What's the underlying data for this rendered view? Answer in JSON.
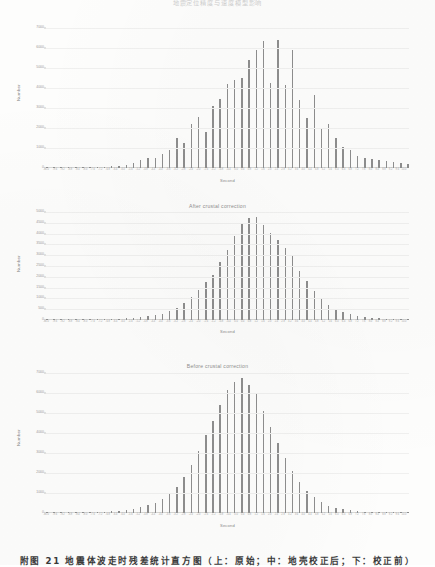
{
  "document": {
    "header_title": "地震定位精度与速度模型影响",
    "caption": "附图 21  地震体波走时残差统计直方图（上：原始；中：地壳校正后；下：校正前）"
  },
  "colors": {
    "bar": "#8e8e8e",
    "grid": "#f0f0ef",
    "axis": "#d8d8d6",
    "text": "#7a7a7a",
    "paper": "#fdfdfc"
  },
  "chart_data": [
    {
      "type": "bar",
      "title": "",
      "xlabel": "Second",
      "ylabel": "Number",
      "ylim": [
        0,
        7000
      ],
      "yticks": [
        0,
        1000,
        2000,
        3000,
        4000,
        5000,
        6000,
        7000
      ],
      "grid": true,
      "legend": "none",
      "categories": [
        "-10.0",
        "-9.6",
        "-9.2",
        "-8.8",
        "-8.4",
        "-8.0",
        "-7.6",
        "-7.2",
        "-6.8",
        "-6.4",
        "-6.0",
        "-5.6",
        "-5.2",
        "-4.8",
        "-4.4",
        "-4.0",
        "-3.6",
        "-3.2",
        "-2.8",
        "-2.4",
        "-2.0",
        "-1.6",
        "-1.2",
        "-0.8",
        "-0.4",
        "0.0",
        "0.4",
        "0.8",
        "1.2",
        "1.6",
        "2.0",
        "2.4",
        "2.8",
        "3.2",
        "3.6",
        "4.0",
        "4.4",
        "4.8",
        "5.2",
        "5.6",
        "6.0",
        "6.4",
        "6.8",
        "7.2",
        "7.6",
        "8.0",
        "8.4",
        "8.8",
        "9.2",
        "9.6",
        "10.0"
      ],
      "values": [
        20,
        25,
        30,
        35,
        40,
        45,
        55,
        60,
        70,
        90,
        110,
        160,
        230,
        420,
        480,
        520,
        700,
        900,
        1500,
        1250,
        2200,
        2550,
        1800,
        3100,
        3450,
        4200,
        4400,
        4500,
        5400,
        5900,
        6350,
        4250,
        6400,
        4150,
        5900,
        3400,
        2500,
        3650,
        2000,
        2200,
        1500,
        1050,
        900,
        600,
        480,
        430,
        380,
        340,
        300,
        260,
        200
      ]
    },
    {
      "type": "bar",
      "title": "After crustal correction",
      "xlabel": "Second",
      "ylabel": "Number",
      "ylim": [
        0,
        5000
      ],
      "yticks": [
        0,
        500,
        1000,
        1500,
        2000,
        2500,
        3000,
        3500,
        4000,
        4500,
        5000
      ],
      "grid": true,
      "legend": "none",
      "categories": [
        "-10.0",
        "-9.6",
        "-9.2",
        "-8.8",
        "-8.4",
        "-8.0",
        "-7.6",
        "-7.2",
        "-6.8",
        "-6.4",
        "-6.0",
        "-5.6",
        "-5.2",
        "-4.8",
        "-4.4",
        "-4.0",
        "-3.6",
        "-3.2",
        "-2.8",
        "-2.4",
        "-2.0",
        "-1.6",
        "-1.2",
        "-0.8",
        "-0.4",
        "0.0",
        "0.4",
        "0.8",
        "1.2",
        "1.6",
        "2.0",
        "2.4",
        "2.8",
        "3.2",
        "3.6",
        "4.0",
        "4.4",
        "4.8",
        "5.2",
        "5.6",
        "6.0",
        "6.4",
        "6.8",
        "7.2",
        "7.6",
        "8.0",
        "8.4",
        "8.8",
        "9.2",
        "9.6",
        "10.0"
      ],
      "values": [
        10,
        12,
        15,
        18,
        20,
        25,
        30,
        35,
        40,
        50,
        60,
        80,
        100,
        130,
        170,
        230,
        300,
        420,
        560,
        780,
        1050,
        1400,
        1750,
        2100,
        2700,
        3250,
        3900,
        4450,
        4700,
        4750,
        4400,
        4050,
        3700,
        3350,
        2950,
        2250,
        1800,
        1350,
        1000,
        700,
        520,
        380,
        280,
        200,
        150,
        110,
        85,
        60,
        45,
        35,
        25
      ]
    },
    {
      "type": "bar",
      "title": "Before crustal correction",
      "xlabel": "Second",
      "ylabel": "Number",
      "ylim": [
        0,
        7000
      ],
      "yticks": [
        0,
        1000,
        2000,
        3000,
        4000,
        5000,
        6000,
        7000
      ],
      "grid": true,
      "legend": "none",
      "categories": [
        "-10.0",
        "-9.6",
        "-9.2",
        "-8.8",
        "-8.4",
        "-8.0",
        "-7.6",
        "-7.2",
        "-6.8",
        "-6.4",
        "-6.0",
        "-5.6",
        "-5.2",
        "-4.8",
        "-4.4",
        "-4.0",
        "-3.6",
        "-3.2",
        "-2.8",
        "-2.4",
        "-2.0",
        "-1.6",
        "-1.2",
        "-0.8",
        "-0.4",
        "0.0",
        "0.4",
        "0.8",
        "1.2",
        "1.6",
        "2.0",
        "2.4",
        "2.8",
        "3.2",
        "3.6",
        "4.0",
        "4.4",
        "4.8",
        "5.2",
        "5.6",
        "6.0",
        "6.4",
        "6.8",
        "7.2",
        "7.6",
        "8.0",
        "8.4",
        "8.8",
        "9.2",
        "9.6",
        "10.0"
      ],
      "values": [
        15,
        18,
        20,
        25,
        30,
        35,
        45,
        55,
        70,
        90,
        120,
        160,
        210,
        280,
        380,
        520,
        700,
        950,
        1300,
        1800,
        2400,
        3100,
        3900,
        4600,
        5400,
        6150,
        6550,
        6750,
        6400,
        5950,
        5100,
        4300,
        3500,
        2750,
        2100,
        1550,
        1100,
        780,
        540,
        370,
        260,
        180,
        130,
        95,
        70,
        55,
        42,
        33,
        26,
        20,
        15
      ]
    }
  ]
}
